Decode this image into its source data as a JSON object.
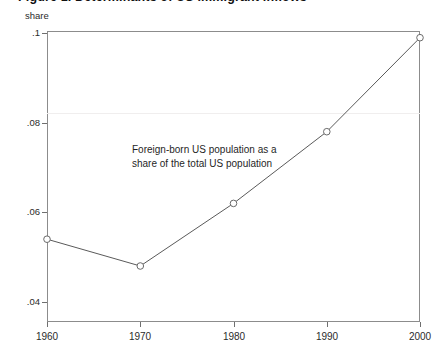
{
  "title": "Figure 1. Determinants of US immigrant inflows",
  "y_axis_caption": "share",
  "annotation": "Foreign-born US population as a\nshare of the total US population",
  "colors": {
    "frame": "#8c8c8c",
    "line": "#5a5a5a",
    "marker_stroke": "#6a6a6a",
    "text": "#2b2b2b",
    "gridline": "#f0eeee"
  },
  "chart_data": {
    "type": "line",
    "title": "Figure 1. Determinants of US immigrant inflows",
    "xlabel": "",
    "ylabel": "share",
    "categories": [
      1960,
      1970,
      1980,
      1990,
      2000
    ],
    "x": [
      1960,
      1970,
      1980,
      1990,
      2000
    ],
    "values": [
      0.054,
      0.048,
      0.062,
      0.078,
      0.099
    ],
    "series": [
      {
        "name": "Foreign-born US population as a share of the total US population",
        "values": [
          0.054,
          0.048,
          0.062,
          0.078,
          0.099
        ]
      }
    ],
    "xlim": [
      1960,
      2000
    ],
    "ylim": [
      0.0355,
      0.1005
    ],
    "xticks": [
      1960,
      1970,
      1980,
      1990,
      2000
    ],
    "xtick_labels": [
      "1960",
      "1970",
      "1980",
      "1990",
      "2000"
    ],
    "yticks": [
      0.04,
      0.06,
      0.08,
      0.1
    ],
    "ytick_labels": [
      ".04",
      ".06",
      ".08",
      ".1"
    ],
    "grid": false,
    "legend": "none",
    "markers": "circle",
    "annotations": [
      {
        "text": "Foreign-born US population as a share of the total US population",
        "x": 1972,
        "y": 0.0715
      }
    ]
  }
}
